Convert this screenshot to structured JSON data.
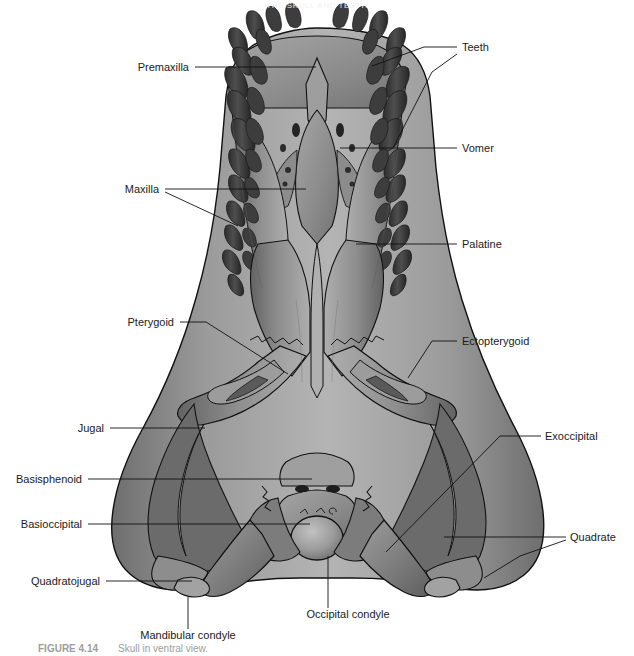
{
  "figure": {
    "top_note": "THE SKULL AND TEETH",
    "caption_number": "FIGURE 4.14",
    "caption_text": "Skull in ventral view.",
    "view": "ventral (palatal) view of an archosaur / crocodilian skull",
    "background_color": "#ffffff",
    "ink_color": "#111111",
    "bone_light": "#b9b9b9",
    "bone_mid": "#8e8e8e",
    "bone_dark": "#6f6f6f",
    "tooth_dark": "#4a4a4a",
    "tooth_darker": "#3a3a3a",
    "shadow": "#2a2a2a"
  },
  "labels": [
    {
      "id": "teeth",
      "text": "Teeth",
      "side": "right",
      "text_x": 462,
      "text_y": 51,
      "leaders": [
        [
          [
            457,
            47
          ],
          [
            424,
            47
          ],
          [
            372,
            66
          ]
        ],
        [
          [
            457,
            54
          ],
          [
            432,
            72
          ],
          [
            393,
            148
          ]
        ]
      ]
    },
    {
      "id": "premaxilla",
      "text": "Premaxilla",
      "side": "left",
      "text_x": 189,
      "text_y": 71,
      "leaders": [
        [
          [
            195,
            67
          ],
          [
            316,
            67
          ]
        ]
      ]
    },
    {
      "id": "vomer",
      "text": "Vomer",
      "side": "right",
      "text_x": 462,
      "text_y": 152,
      "leaders": [
        [
          [
            457,
            148
          ],
          [
            432,
            148
          ],
          [
            340,
            148
          ]
        ]
      ]
    },
    {
      "id": "maxilla",
      "text": "Maxilla",
      "side": "left",
      "text_x": 159,
      "text_y": 193,
      "leaders": [
        [
          [
            165,
            189
          ],
          [
            228,
            189
          ],
          [
            306,
            189
          ]
        ],
        [
          [
            165,
            192
          ],
          [
            238,
            226
          ]
        ]
      ]
    },
    {
      "id": "palatine",
      "text": "Palatine",
      "side": "right",
      "text_x": 462,
      "text_y": 248,
      "leaders": [
        [
          [
            457,
            244
          ],
          [
            420,
            244
          ],
          [
            356,
            244
          ]
        ]
      ]
    },
    {
      "id": "pterygoid",
      "text": "Pterygoid",
      "side": "left",
      "text_x": 174,
      "text_y": 326,
      "leaders": [
        [
          [
            180,
            322
          ],
          [
            206,
            322
          ],
          [
            288,
            374
          ]
        ]
      ]
    },
    {
      "id": "ectopterygoid",
      "text": "Ectopterygoid",
      "side": "right",
      "text_x": 462,
      "text_y": 345,
      "leaders": [
        [
          [
            457,
            341
          ],
          [
            432,
            341
          ],
          [
            408,
            378
          ]
        ]
      ]
    },
    {
      "id": "jugal",
      "text": "Jugal",
      "side": "left",
      "text_x": 104,
      "text_y": 432,
      "leaders": [
        [
          [
            110,
            428
          ],
          [
            148,
            428
          ],
          [
            205,
            428
          ]
        ]
      ]
    },
    {
      "id": "exoccipital",
      "text": "Exoccipital",
      "side": "right",
      "text_x": 545,
      "text_y": 440,
      "leaders": [
        [
          [
            541,
            436
          ],
          [
            500,
            436
          ],
          [
            386,
            552
          ]
        ]
      ]
    },
    {
      "id": "basisphenoid",
      "text": "Basisphenoid",
      "side": "left",
      "text_x": 82,
      "text_y": 483,
      "leaders": [
        [
          [
            88,
            479
          ],
          [
            180,
            479
          ],
          [
            312,
            479
          ]
        ]
      ]
    },
    {
      "id": "basioccipital",
      "text": "Basioccipital",
      "side": "left",
      "text_x": 82,
      "text_y": 528,
      "leaders": [
        [
          [
            88,
            524
          ],
          [
            200,
            524
          ],
          [
            310,
            524
          ]
        ]
      ]
    },
    {
      "id": "quadrate",
      "text": "Quadrate",
      "side": "right",
      "text_x": 570,
      "text_y": 541,
      "leaders": [
        [
          [
            566,
            537
          ],
          [
            520,
            537
          ],
          [
            444,
            537
          ]
        ],
        [
          [
            566,
            540
          ],
          [
            520,
            556
          ],
          [
            484,
            578
          ]
        ]
      ]
    },
    {
      "id": "quadratojugal",
      "text": "Quadratojugal",
      "side": "left",
      "text_x": 100,
      "text_y": 585,
      "leaders": [
        [
          [
            106,
            581
          ],
          [
            160,
            581
          ],
          [
            192,
            581
          ]
        ]
      ]
    },
    {
      "id": "mandibular-condyle",
      "text": "Mandibular condyle",
      "side": "bottom",
      "text_x": 188,
      "text_y": 639,
      "leaders": [
        [
          [
            188,
            629
          ],
          [
            188,
            597
          ]
        ]
      ]
    },
    {
      "id": "occipital-condyle",
      "text": "Occipital condyle",
      "side": "bottom",
      "text_x": 348,
      "text_y": 618,
      "leaders": [
        [
          [
            328,
            608
          ],
          [
            328,
            556
          ]
        ]
      ]
    }
  ]
}
